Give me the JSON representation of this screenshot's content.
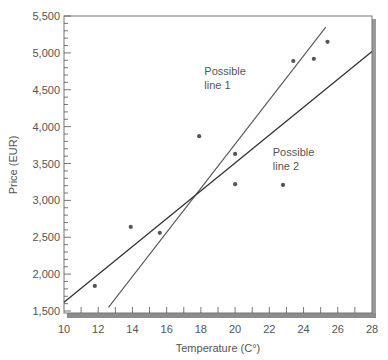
{
  "chart_data": {
    "type": "scatter",
    "title": "",
    "xlabel": "Temperature (C°)",
    "ylabel": "Price (EUR)",
    "xlim": [
      10,
      28
    ],
    "ylim": [
      1500,
      5500
    ],
    "x_ticks": [
      10,
      12,
      14,
      16,
      18,
      20,
      22,
      24,
      26,
      28
    ],
    "x_tick_labels": [
      "10",
      "12",
      "14",
      "16",
      "18",
      "20",
      "22",
      "24",
      "26",
      "28"
    ],
    "y_ticks": [
      1500,
      2000,
      2500,
      3000,
      3500,
      4000,
      4500,
      5000,
      5500
    ],
    "y_tick_labels": [
      "1,500",
      "2,000",
      "2,500",
      "3,000",
      "3,500",
      "4,000",
      "4,500",
      "5,000",
      "5,500"
    ],
    "grid": false,
    "legend": null,
    "series": [
      {
        "name": "observations",
        "type": "scatter",
        "points": [
          {
            "x": 11.8,
            "y": 1840
          },
          {
            "x": 13.9,
            "y": 2640
          },
          {
            "x": 15.6,
            "y": 2560
          },
          {
            "x": 17.9,
            "y": 3870
          },
          {
            "x": 20.0,
            "y": 3630
          },
          {
            "x": 20.0,
            "y": 3220
          },
          {
            "x": 22.8,
            "y": 3210
          },
          {
            "x": 23.4,
            "y": 4890
          },
          {
            "x": 24.6,
            "y": 4920
          },
          {
            "x": 25.4,
            "y": 5150
          }
        ]
      },
      {
        "name": "Possible line 1",
        "type": "line",
        "points": [
          {
            "x": 12.6,
            "y": 1550
          },
          {
            "x": 25.3,
            "y": 5350
          }
        ]
      },
      {
        "name": "Possible line 2",
        "type": "line",
        "points": [
          {
            "x": 10.0,
            "y": 1620
          },
          {
            "x": 28.0,
            "y": 5020
          }
        ]
      }
    ],
    "annotations": [
      {
        "text": [
          "Possible",
          "line 1"
        ],
        "x": 18.2,
        "y": 4700
      },
      {
        "text": [
          "Possible",
          "line 2"
        ],
        "x": 22.2,
        "y": 3600
      }
    ]
  },
  "colors": {
    "axis": "#555555",
    "frame": "#777777",
    "frame_shadow": "#9a9a9a",
    "text": "#555555",
    "point": "#555555",
    "line1": "#555555",
    "line2": "#333333"
  }
}
